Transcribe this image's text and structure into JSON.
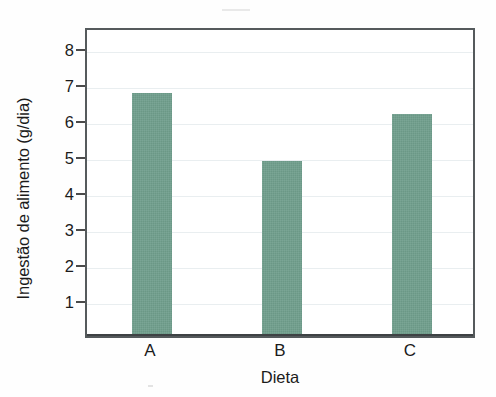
{
  "chart_data": {
    "type": "bar",
    "title": "",
    "subtitle": "",
    "categories": [
      "A",
      "B",
      "C"
    ],
    "values": [
      6.75,
      4.85,
      6.15
    ],
    "series": [
      {
        "name": "Ingestão de alimento",
        "values": [
          6.75,
          4.85,
          6.15
        ]
      }
    ],
    "xlabel": "Dieta",
    "ylabel": "Ingestão de alimento (g/dia)",
    "ylim": [
      0,
      8.6
    ],
    "xlim": [
      0,
      3
    ],
    "yticks": [
      1,
      2,
      3,
      4,
      5,
      6,
      7,
      8
    ],
    "ytick_labels": [
      "1",
      "2",
      "3",
      "4",
      "5",
      "6",
      "7",
      "8"
    ],
    "xtick_labels": [
      "A",
      "B",
      "C"
    ],
    "grid": true,
    "grid_axis": "y",
    "legend": false,
    "legend_position": "none",
    "bar_color": "#6f9e8c",
    "grid_color": "#e9eef0",
    "axis_color": "#555a5c",
    "text_color": "#1b1b1b",
    "background_color": "#ffffff",
    "annotations": []
  },
  "axes": {
    "y_title": "Ingestão de alimento (g/dia)",
    "x_title": "Dieta"
  }
}
